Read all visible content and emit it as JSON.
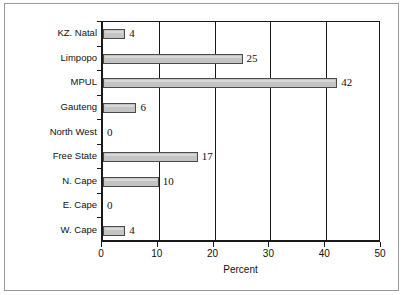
{
  "chart_data": {
    "type": "bar",
    "orientation": "horizontal",
    "title": "",
    "xlabel": "Percent",
    "ylabel": "",
    "categories": [
      "KZ. Natal",
      "Limpopo",
      "MPUL",
      "Gauteng",
      "North West",
      "Free State",
      "N. Cape",
      "E. Cape",
      "W. Cape"
    ],
    "values": [
      4,
      25,
      42,
      6,
      0,
      17,
      10,
      0,
      4
    ],
    "data_labels": [
      "4",
      "25",
      "42",
      "6",
      "0",
      "17",
      "10",
      "0",
      "4"
    ],
    "xlim": [
      0,
      50
    ],
    "xticks": [
      0,
      10,
      20,
      30,
      40,
      50
    ],
    "xtick_labels": [
      "0",
      "10",
      "20",
      "30",
      "40",
      "50"
    ],
    "grid": "vertical",
    "legend": "none",
    "bar_fill_color": "#c4c4c4",
    "bar_edge_color": "#4a4a4a",
    "axis_color": "#1a1a1a",
    "background_color": "#ffffff"
  }
}
